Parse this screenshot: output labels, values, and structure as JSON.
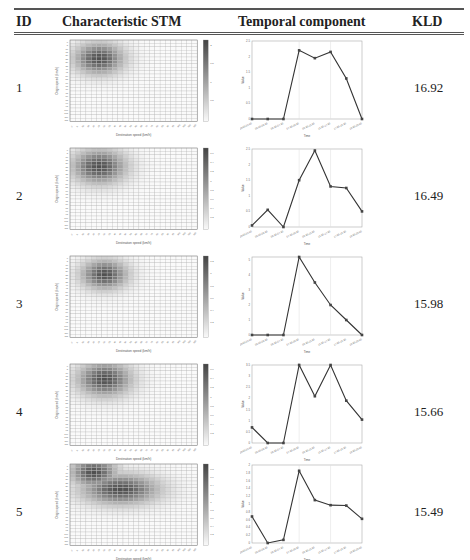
{
  "table": {
    "headers": {
      "id": "ID",
      "stm": "Characteristic STM",
      "temporal": "Temporal component",
      "kld": "KLD"
    },
    "heatmap_axis": {
      "xlabel": "Destination speed (km/h)",
      "ylabel": "Origin speed (km/h)"
    },
    "line_axis": {
      "xlabel": "Time",
      "ylabel": "Value"
    },
    "time_ticks": [
      "22:00-04:00",
      "06:00-06:30",
      "06:30-07:30",
      "07:30-09:30",
      "09:30-15:30",
      "15:30-17:30",
      "17:30-19:30",
      "19:30-22:00"
    ],
    "rows": [
      {
        "id": "1",
        "kld": "16.92",
        "line_ymax": 2.5,
        "line_yticks": [
          "0",
          "0.5",
          "1",
          "1.5",
          "2",
          "2.5"
        ],
        "cbar_ticks": [
          "2",
          "1.5",
          "1",
          "0.5"
        ],
        "values": [
          0,
          0,
          0,
          2.2,
          1.95,
          2.15,
          1.3,
          0
        ]
      },
      {
        "id": "2",
        "kld": "16.49",
        "line_ymax": 2.5,
        "line_yticks": [
          "0",
          "0.5",
          "1",
          "1.5",
          "2",
          "2.5"
        ],
        "cbar_ticks": [
          "1.6",
          "1.4",
          "1.2",
          "1",
          "0.8",
          "0.6",
          "0.4",
          "0.2"
        ],
        "values": [
          0.05,
          0.55,
          0,
          1.5,
          2.45,
          1.3,
          1.25,
          0.5
        ]
      },
      {
        "id": "3",
        "kld": "15.98",
        "line_ymax": 5,
        "line_yticks": [
          "0",
          "1",
          "2",
          "3",
          "4",
          "5"
        ],
        "cbar_ticks": [
          "1.2",
          "1",
          "0.8",
          "0.6",
          "0.4",
          "0.2"
        ],
        "values": [
          0,
          0,
          0,
          5.2,
          3.5,
          2,
          1,
          0
        ]
      },
      {
        "id": "4",
        "kld": "15.66",
        "line_ymax": 3.5,
        "line_yticks": [
          "0",
          "0.5",
          "1",
          "1.5",
          "2",
          "2.5",
          "3",
          "3.5"
        ],
        "cbar_ticks": [
          "1.6",
          "1.4",
          "1.2",
          "1",
          "0.8",
          "0.6",
          "0.4",
          "0.2"
        ],
        "values": [
          0.7,
          0,
          0,
          3.5,
          2.1,
          3.5,
          1.9,
          1.05
        ]
      },
      {
        "id": "5",
        "kld": "15.49",
        "line_ymax": 2,
        "line_yticks": [
          "0",
          "0.2",
          "0.4",
          "0.6",
          "0.8",
          "1",
          "1.2",
          "1.4",
          "1.6",
          "1.8",
          "2"
        ],
        "cbar_ticks": [
          "1.8",
          "1.6",
          "1.4",
          "1.2",
          "1",
          "0.8",
          "0.6",
          "0.4",
          "0.2"
        ],
        "values": [
          0.68,
          0,
          0.08,
          1.85,
          1.1,
          0.97,
          0.96,
          0.62
        ]
      }
    ]
  },
  "chart_data": [
    {
      "type": "line",
      "title": "Temporal component 1",
      "xlabel": "Time",
      "ylabel": "Value",
      "categories": [
        "22:00-04:00",
        "06:00-06:30",
        "06:30-07:30",
        "07:30-09:30",
        "09:30-15:30",
        "15:30-17:30",
        "17:30-19:30",
        "19:30-22:00"
      ],
      "values": [
        0,
        0,
        0,
        2.2,
        1.95,
        2.15,
        1.3,
        0
      ],
      "ylim": [
        0,
        2.5
      ]
    },
    {
      "type": "line",
      "title": "Temporal component 2",
      "xlabel": "Time",
      "ylabel": "Value",
      "categories": [
        "22:00-04:00",
        "06:00-06:30",
        "06:30-07:30",
        "07:30-09:30",
        "09:30-15:30",
        "15:30-17:30",
        "17:30-19:30",
        "19:30-22:00"
      ],
      "values": [
        0.05,
        0.55,
        0,
        1.5,
        2.45,
        1.3,
        1.25,
        0.5
      ],
      "ylim": [
        0,
        2.5
      ]
    },
    {
      "type": "line",
      "title": "Temporal component 3",
      "xlabel": "Time",
      "ylabel": "Value",
      "categories": [
        "22:00-04:00",
        "06:00-06:30",
        "06:30-07:30",
        "07:30-09:30",
        "09:30-15:30",
        "15:30-17:30",
        "17:30-19:30",
        "19:30-22:00"
      ],
      "values": [
        0,
        0,
        0,
        5.2,
        3.5,
        2,
        1,
        0
      ],
      "ylim": [
        0,
        5.5
      ]
    },
    {
      "type": "line",
      "title": "Temporal component 4",
      "xlabel": "Time",
      "ylabel": "Value",
      "categories": [
        "22:00-04:00",
        "06:00-06:30",
        "06:30-07:30",
        "07:30-09:30",
        "09:30-15:30",
        "15:30-17:30",
        "17:30-19:30",
        "19:30-22:00"
      ],
      "values": [
        0.7,
        0,
        0,
        3.5,
        2.1,
        3.5,
        1.9,
        1.05
      ],
      "ylim": [
        0,
        3.5
      ]
    },
    {
      "type": "line",
      "title": "Temporal component 5",
      "xlabel": "Time",
      "ylabel": "Value",
      "categories": [
        "22:00-04:00",
        "06:00-06:30",
        "06:30-07:30",
        "07:30-09:30",
        "09:30-15:30",
        "15:30-17:30",
        "17:30-19:30",
        "19:30-22:00"
      ],
      "values": [
        0.68,
        0,
        0.08,
        1.85,
        1.1,
        0.97,
        0.96,
        0.62
      ],
      "ylim": [
        0,
        2
      ]
    },
    {
      "type": "table",
      "columns": [
        "ID",
        "KLD"
      ],
      "rows": [
        [
          "1",
          16.92
        ],
        [
          "2",
          16.49
        ],
        [
          "3",
          15.98
        ],
        [
          "4",
          15.66
        ],
        [
          "5",
          15.49
        ]
      ]
    }
  ]
}
